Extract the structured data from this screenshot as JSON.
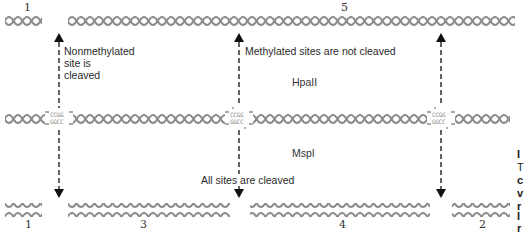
{
  "diagram": {
    "type": "restriction digest comparison",
    "enzymes": {
      "top": "HpaII",
      "bottom": "MspI"
    },
    "site_sequence": {
      "top_strand": "CCGG",
      "bottom_strand": "GGCC"
    },
    "annotations": {
      "left": [
        "Nonmethylated",
        "site is",
        "cleaved"
      ],
      "top_middle": "Methylated sites are not cleaved",
      "bottom_middle": "All sites are cleaved"
    },
    "fragments_top": [
      {
        "label": "1"
      },
      {
        "label": "5"
      }
    ],
    "fragments_bottom": [
      {
        "label": "1"
      },
      {
        "label": "3"
      },
      {
        "label": "4"
      },
      {
        "label": "2"
      }
    ],
    "sites": [
      {
        "x": 59,
        "methylated": false
      },
      {
        "x": 239,
        "methylated": true
      },
      {
        "x": 441,
        "methylated": true
      }
    ],
    "edge_fragments": [
      "I",
      "T",
      "c",
      "v",
      "r",
      "I",
      "r"
    ],
    "colors": {
      "dna": "#8c8c8c",
      "arrow": "#111111",
      "text": "#2a2a2a"
    }
  }
}
